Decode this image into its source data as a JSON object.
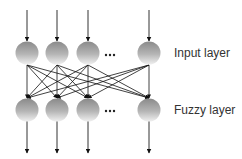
{
  "diagram": {
    "type": "neural-network-layers",
    "layers": [
      {
        "id": "input",
        "label": "Input layer",
        "node_count_visible": 4,
        "ellipsis": "…",
        "center_y": 53
      },
      {
        "id": "fuzzy",
        "label": "Fuzzy layer",
        "node_count_visible": 4,
        "ellipsis": "…",
        "center_y": 110
      }
    ],
    "node_x": [
      27,
      57,
      88,
      149
    ],
    "node_radius": 11.5,
    "connections": "fully-connected input to fuzzy",
    "incoming_arrows": "one per input node from top",
    "outgoing_arrows": "one per fuzzy node to bottom",
    "colors": {
      "node_top": "#8a8a8a",
      "node_bottom": "#f0f0f0",
      "line": "#111111",
      "text": "#333333"
    }
  }
}
